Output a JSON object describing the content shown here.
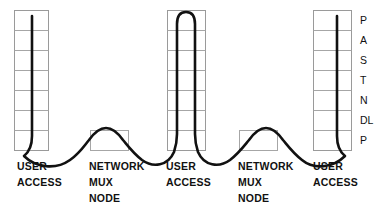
{
  "figure": {
    "type": "network-protocol-stack-diagram",
    "width": 390,
    "height": 220,
    "background_color": "#ffffff",
    "line_color": "#111111",
    "grid_color": "#a6a6a6"
  },
  "layer_legend": {
    "name": "osi-layer-abbreviations",
    "items": [
      {
        "label": "P"
      },
      {
        "label": "A"
      },
      {
        "label": "S"
      },
      {
        "label": "T"
      },
      {
        "label": "N"
      },
      {
        "label": "DL"
      },
      {
        "label": "P"
      }
    ]
  },
  "nodes": [
    {
      "id": "user-access-left",
      "kind": "stack",
      "label_lines": [
        "USER",
        "ACCESS"
      ],
      "layers": 7
    },
    {
      "id": "network-mux-node-left",
      "kind": "mux",
      "label_lines": [
        "NETWORK",
        "MUX",
        "NODE"
      ],
      "layers": 1
    },
    {
      "id": "user-access-center",
      "kind": "stack",
      "label_lines": [
        "USER",
        "ACCESS"
      ],
      "layers": 7
    },
    {
      "id": "network-mux-node-right",
      "kind": "mux",
      "label_lines": [
        "NETWORK",
        "MUX",
        "NODE"
      ],
      "layers": 1
    },
    {
      "id": "user-access-right",
      "kind": "stack",
      "label_lines": [
        "USER",
        "ACCESS"
      ],
      "layers": 7
    }
  ]
}
